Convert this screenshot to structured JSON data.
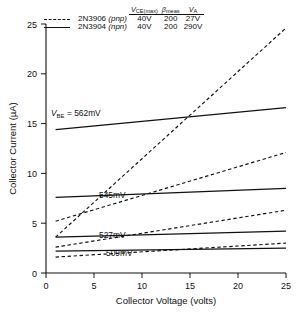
{
  "chart_data": {
    "type": "line",
    "title": "",
    "xlabel": "Collector Voltage (volts)",
    "ylabel": "Collector Current (µA)",
    "xlim": [
      0,
      25
    ],
    "ylim": [
      0,
      25
    ],
    "xticks": [
      "0",
      "5",
      "10",
      "15",
      "20",
      "25"
    ],
    "yticks": [
      "0",
      "5",
      "10",
      "15",
      "20",
      "25"
    ],
    "grid": false,
    "legend_position": "top-right",
    "series": [
      {
        "name": "2N3906 (pnp) VBE = 562mV",
        "style": "dashed",
        "x": [
          1,
          25
        ],
        "y": [
          3.6,
          24.6
        ]
      },
      {
        "name": "2N3904 (npn) VBE = 562mV",
        "style": "solid",
        "x": [
          1,
          25
        ],
        "y": [
          14.4,
          16.6
        ]
      },
      {
        "name": "2N3906 (pnp) 545mV",
        "style": "dashed",
        "x": [
          1,
          25
        ],
        "y": [
          5.2,
          12.1
        ]
      },
      {
        "name": "2N3904 (npn) 545mV",
        "style": "solid",
        "x": [
          1,
          25
        ],
        "y": [
          7.6,
          8.5
        ]
      },
      {
        "name": "2N3906 (pnp) 527mV",
        "style": "dashed",
        "x": [
          1,
          25
        ],
        "y": [
          2.6,
          6.3
        ]
      },
      {
        "name": "2N3904 (npn) 527mV",
        "style": "solid",
        "x": [
          1,
          25
        ],
        "y": [
          3.6,
          4.2
        ]
      },
      {
        "name": "2N3906 (pnp) 509mV",
        "style": "dashed",
        "x": [
          1,
          25
        ],
        "y": [
          1.6,
          3.0
        ]
      },
      {
        "name": "2N3904 (npn) 509mV",
        "style": "solid",
        "x": [
          1,
          25
        ],
        "y": [
          2.2,
          2.5
        ]
      }
    ],
    "annotations": [
      {
        "text": "VBE = 562mV",
        "x": 1.3,
        "y": 15.9
      },
      {
        "text": "545mV",
        "x": 6.5,
        "y": 9.0
      },
      {
        "text": "527mV",
        "x": 6.5,
        "y": 4.9
      },
      {
        "text": "509mV",
        "x": 7.2,
        "y": 3.1
      }
    ]
  },
  "legend": {
    "headers": {
      "blank": "",
      "vce": "V",
      "vce_sub": "CE(max)",
      "beta": "β",
      "beta_sub": "meas",
      "va": "V",
      "va_sub": "A"
    },
    "rows": [
      {
        "key": "dashed-line-key",
        "device": "2N3906",
        "type": "(pnp)",
        "vce": "40V",
        "beta": "200",
        "va": "27V"
      },
      {
        "key": "solid-line-key",
        "device": "2N3904",
        "type": "(npn)",
        "vce": "40V",
        "beta": "200",
        "va": "290V"
      }
    ]
  },
  "annotations": {
    "a0_pre": "V",
    "a0_sub": "BE",
    "a0_post": " = 562mV",
    "a1": "545mV",
    "a2": "527mV",
    "a3": "509mV"
  },
  "axes": {
    "xlabel": "Collector Voltage (volts)",
    "ylabel": "Collector Current (µA)",
    "x_tick_0": "0",
    "x_tick_1": "5",
    "x_tick_2": "10",
    "x_tick_3": "15",
    "x_tick_4": "20",
    "x_tick_5": "25",
    "y_tick_0": "0",
    "y_tick_1": "5",
    "y_tick_2": "10",
    "y_tick_3": "15",
    "y_tick_4": "20",
    "y_tick_5": "25"
  },
  "colors": {
    "ink": "#111111",
    "background": "#ffffff"
  }
}
